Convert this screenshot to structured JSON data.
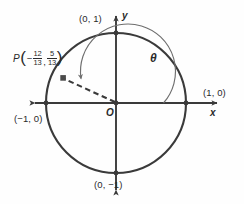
{
  "figure": {
    "name": "unit-circle-diagram",
    "background_color": "#fefefe",
    "stroke_color": "#3a3a3a",
    "arc_color": "#6e6e6e",
    "text_color": "#2a2a2a"
  },
  "axes": {
    "x_label": "x",
    "y_label": "y",
    "origin_label": "O"
  },
  "intercepts": {
    "top": "(0, 1)",
    "right": "(1, 0)",
    "bottom": "(0, −1)",
    "left": "(−1, 0)"
  },
  "angle": {
    "label": "θ"
  },
  "point": {
    "name": "P",
    "open_paren": "(",
    "close_paren": ")",
    "x_sign": "−",
    "x_numerator": "12",
    "x_denominator": "13",
    "separator": ",",
    "y_numerator": "5",
    "y_denominator": "13"
  },
  "geometry": {
    "center_x": 116,
    "center_y": 103,
    "radius": 70,
    "point_x": 63,
    "point_y": 78
  }
}
